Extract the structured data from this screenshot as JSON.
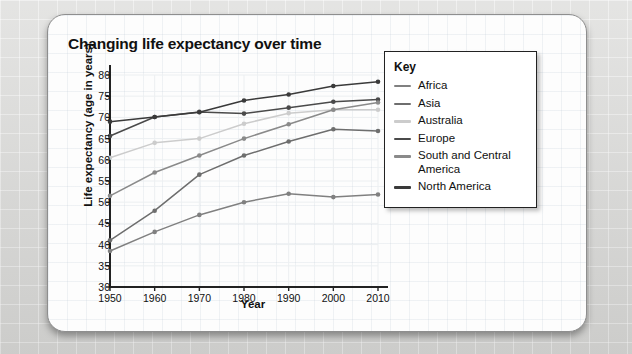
{
  "card": {
    "title": "Changing life expectancy over time"
  },
  "legend": {
    "title": "Key"
  },
  "chart_data": {
    "type": "line",
    "title": "Changing life expectancy over time",
    "xlabel": "Year",
    "ylabel": "Life expectancy (age in years)",
    "x": [
      1950,
      1960,
      1970,
      1980,
      1990,
      2000,
      2010
    ],
    "xtick_labels": [
      "1950",
      "1960",
      "1970",
      "1980",
      "1990",
      "2000",
      "2010"
    ],
    "ytick_labels": [
      "80",
      "75",
      "70",
      "65",
      "60",
      "55",
      "50",
      "45",
      "40",
      "35",
      "30"
    ],
    "xlim": [
      1950,
      2010
    ],
    "ylim": [
      30,
      80
    ],
    "ystep": 5,
    "grid": true,
    "legend_position": "right",
    "markers": true,
    "series": [
      {
        "name": "Africa",
        "color": "#808080",
        "values": [
          38.5,
          43.0,
          47.0,
          50.0,
          52.0,
          51.2,
          51.8
        ]
      },
      {
        "name": "Asia",
        "color": "#6e6e6e",
        "values": [
          41.0,
          48.0,
          56.5,
          61.0,
          64.3,
          67.2,
          66.8
        ]
      },
      {
        "name": "Australia",
        "color": "#cccccc",
        "values": [
          60.5,
          64.0,
          65.0,
          68.5,
          71.0,
          71.8,
          71.8
        ]
      },
      {
        "name": "Europe",
        "color": "#4a4a4a",
        "values": [
          65.6,
          70.1,
          71.3,
          70.9,
          72.3,
          73.7,
          74.2
        ]
      },
      {
        "name": "South and Central America",
        "color": "#8a8a8a",
        "values": [
          51.5,
          57.0,
          61.0,
          65.0,
          68.4,
          71.8,
          73.5
        ]
      },
      {
        "name": "North America",
        "color": "#3a3a3a",
        "values": [
          69.0,
          70.1,
          71.2,
          74.0,
          75.4,
          77.4,
          78.4
        ]
      }
    ]
  }
}
